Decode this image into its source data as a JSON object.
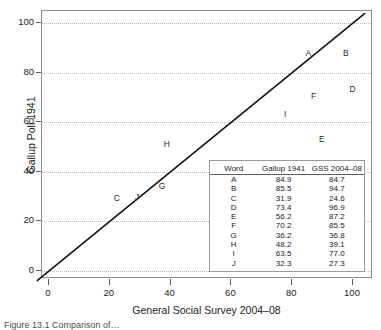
{
  "figure": {
    "caption": "Figure 13.1  Comparison of…"
  },
  "chart_data": {
    "type": "scatter",
    "title": "",
    "xlabel": "General Social Survey 2004–08",
    "ylabel": "Gallup Poll 1941",
    "xlim": [
      -4,
      104
    ],
    "ylim": [
      -5,
      103
    ],
    "xticks": [
      0,
      20,
      40,
      60,
      80,
      100
    ],
    "yticks": [
      0,
      20,
      40,
      60,
      80,
      100
    ],
    "grid": true,
    "grid_axis": "y",
    "reference_line": {
      "type": "identity",
      "label": "y = x",
      "from": [
        -4,
        -4
      ],
      "to": [
        104,
        104
      ]
    },
    "point_label_field": "word",
    "x_field": "gss_2004_08",
    "y_field": "gallup_1941",
    "points": [
      {
        "word": "A",
        "gallup_1941": 84.9,
        "gss_2004_08": 84.7
      },
      {
        "word": "B",
        "gallup_1941": 85.5,
        "gss_2004_08": 94.7
      },
      {
        "word": "C",
        "gallup_1941": 31.9,
        "gss_2004_08": 24.6
      },
      {
        "word": "D",
        "gallup_1941": 73.4,
        "gss_2004_08": 96.9
      },
      {
        "word": "E",
        "gallup_1941": 56.2,
        "gss_2004_08": 87.2
      },
      {
        "word": "F",
        "gallup_1941": 70.2,
        "gss_2004_08": 85.5
      },
      {
        "word": "G",
        "gallup_1941": 36.2,
        "gss_2004_08": 36.8
      },
      {
        "word": "H",
        "gallup_1941": 48.2,
        "gss_2004_08": 39.1
      },
      {
        "word": "I",
        "gallup_1941": 63.5,
        "gss_2004_08": 77.0
      },
      {
        "word": "J",
        "gallup_1941": 32.3,
        "gss_2004_08": 27.3
      }
    ]
  },
  "axes": {
    "y": {
      "title": "Gallup Poll 1941",
      "ticks": [
        "0",
        "20",
        "40",
        "60",
        "80",
        "100"
      ]
    },
    "x": {
      "title": "General Social Survey 2004–08",
      "ticks": [
        "0",
        "20",
        "40",
        "60",
        "80",
        "100"
      ]
    }
  },
  "inset_table": {
    "headers": [
      "Word",
      "Gallup 1941",
      "GSS 2004–08"
    ],
    "rows": [
      [
        "A",
        "84.9",
        "84.7"
      ],
      [
        "B",
        "85.5",
        "94.7"
      ],
      [
        "C",
        "31.9",
        "24.6"
      ],
      [
        "D",
        "73.4",
        "96.9"
      ],
      [
        "E",
        "56.2",
        "87.2"
      ],
      [
        "F",
        "70.2",
        "85.5"
      ],
      [
        "G",
        "36.2",
        "36.8"
      ],
      [
        "H",
        "48.2",
        "39.1"
      ],
      [
        "I",
        "63.5",
        "77.0"
      ],
      [
        "J",
        "32.3",
        "27.3"
      ]
    ]
  },
  "colors": {
    "frame": "#8e8e8e",
    "gridline": "#b9b9c4",
    "line": "#111111",
    "text": "#1a1a1a",
    "background": "#ffffff"
  }
}
